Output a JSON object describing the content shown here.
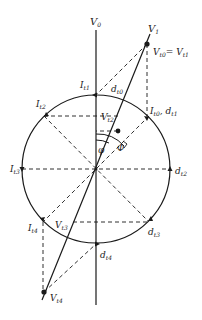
{
  "diagram": {
    "type": "phasor-circle",
    "axis_label": "V",
    "axis_sub": "0",
    "labels": {
      "v1": {
        "main": "V",
        "sub": "1"
      },
      "vt0_eq_vt1": {
        "main": "V",
        "sub": "t0",
        "eq": "= V",
        "sub2": "t1"
      },
      "it1": {
        "main": "I",
        "sub": "t1"
      },
      "dt0": {
        "main": "d",
        "sub": "t0"
      },
      "it0_dt1": {
        "main": "I",
        "sub": "t0",
        "sep": ", d",
        "sub2": "t1"
      },
      "it2": {
        "main": "I",
        "sub": "t2"
      },
      "vt2": {
        "main": "V",
        "sub": "t2"
      },
      "phi_small": "φ",
      "phi_big": "Φ",
      "it3": {
        "main": "I",
        "sub": "t3"
      },
      "dt2": {
        "main": "d",
        "sub": "t2"
      },
      "it4": {
        "main": "I",
        "sub": "t4"
      },
      "vt3": {
        "main": "V",
        "sub": "t3"
      },
      "dt3": {
        "main": "d",
        "sub": "t3"
      },
      "dt4": {
        "main": "d",
        "sub": "t4"
      },
      "vt4": {
        "main": "V",
        "sub": "t4"
      }
    },
    "colors": {
      "stroke": "#1a1a1a",
      "background": "#ffffff"
    }
  }
}
